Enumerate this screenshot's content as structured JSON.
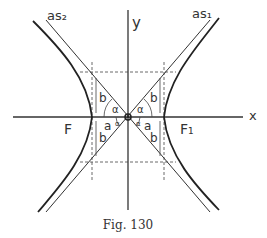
{
  "figure": {
    "caption": "Fig. 130",
    "axes": {
      "x_label": "x",
      "y_label": "y"
    },
    "asymptotes": {
      "left": "as₂",
      "right": "as₁"
    },
    "foci": {
      "left": "F",
      "right": "F₁"
    },
    "segment_labels": {
      "a": "a",
      "b": "b",
      "alpha": "α"
    },
    "colors": {
      "line": "#333333",
      "background": "#ffffff"
    }
  }
}
